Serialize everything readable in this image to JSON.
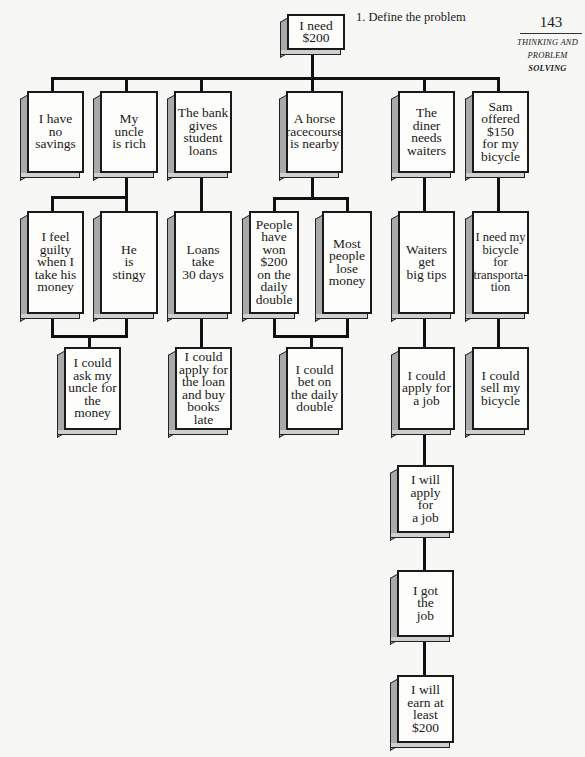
{
  "header": {
    "step_caption": "1. Define the problem",
    "page_number": "143",
    "running_head_line1": "THINKING AND",
    "running_head_line2_a": "PROBLEM",
    "running_head_line2_b": "SOLVING"
  },
  "tree": {
    "root": "I need $200",
    "row1": [
      "I have\nno\nsavings",
      "My\nuncle\nis rich",
      "The bank\ngives\nstudent\nloans",
      "A horse\nracecourse\nis nearby",
      "The diner\nneeds\nwaiters",
      "Sam\noffered\n$150\nfor my\nbicycle"
    ],
    "row2": [
      "I feel\nguilty\nwhen I\ntake his\nmoney",
      "He\nis\nstingy",
      "Loans\ntake\n30 days",
      "People\nhave\nwon\n$200\non the\ndaily\ndouble",
      "Most\npeople\nlose\nmoney",
      "Waiters\nget\nbig tips",
      "I need my\nbicycle\nfor\ntransporta-\ntion"
    ],
    "row3": [
      "I could\nask my\nuncle for\nthe money",
      "I could\napply for\nthe loan\nand buy\nbooks late",
      "I could\nbet on\nthe daily\ndouble",
      "I could\napply for\na job",
      "I could\nsell my\nbicycle"
    ],
    "chain": [
      "I will\napply\nfor\na job",
      "I got\nthe\njob",
      "I will\nearn at\nleast\n$200"
    ]
  },
  "colors": {
    "line": "#111111",
    "box_face": "#fdfdfb",
    "box_side": "#a9a9a9",
    "page_bg": "#f7f7f5"
  }
}
